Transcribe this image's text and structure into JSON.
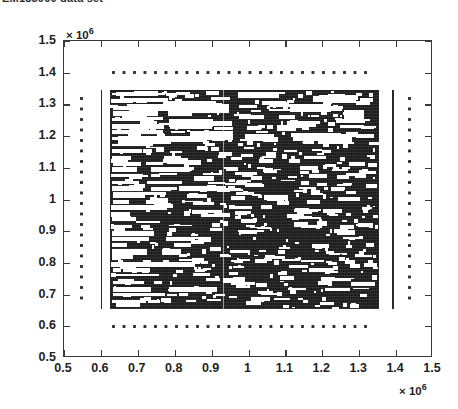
{
  "caption": {
    "text": "EM185900 data set"
  },
  "chart_data": {
    "type": "scatter",
    "title": "EM185900 data set",
    "xlabel": "",
    "ylabel": "",
    "grid": false,
    "legend": null,
    "x_multiplier": "× 10",
    "x_multiplier_exp": "6",
    "y_multiplier": "× 10",
    "y_multiplier_exp": "6",
    "xlim": [
      500000,
      1500000
    ],
    "ylim": [
      500000,
      1500000
    ],
    "x_ticks": [
      0.5,
      0.6,
      0.7,
      0.8,
      0.9,
      1,
      1.1,
      1.2,
      1.3,
      1.4,
      1.5
    ],
    "y_ticks": [
      0.5,
      0.6,
      0.7,
      0.8,
      0.9,
      1,
      1.1,
      1.2,
      1.3,
      1.4,
      1.5
    ],
    "x_tick_labels": [
      "0.5",
      "0.6",
      "0.7",
      "0.8",
      "0.9",
      "1",
      "1.1",
      "1.2",
      "1.3",
      "1.4",
      "1.5"
    ],
    "y_tick_labels": [
      "0.5",
      "0.6",
      "0.7",
      "0.8",
      "0.9",
      "1",
      "1.1",
      "1.2",
      "1.3",
      "1.4",
      "1.5"
    ],
    "marker_color": "#1b1b1b",
    "background_color": "#ffffff",
    "axis_color": "#3a3a3a",
    "clusters": [
      {
        "name": "main-block",
        "shape": "filled-rectangle",
        "x_range": [
          625000,
          1355000
        ],
        "y_range": [
          655000,
          1345000
        ],
        "density": "very-high",
        "notes": "near-solid black fill with white rectangular voids; left margin heavily striped"
      },
      {
        "name": "left-solid-line",
        "shape": "vertical-line",
        "x": 600000,
        "y_range": [
          655000,
          1345000
        ],
        "density": "high"
      },
      {
        "name": "right-solid-line",
        "shape": "vertical-line",
        "x": 1390000,
        "y_range": [
          655000,
          1345000
        ],
        "density": "high"
      },
      {
        "name": "left-dotted-column",
        "shape": "dotted-vertical",
        "x": 550000,
        "y_range": [
          680000,
          1320000
        ],
        "spacing": 28000
      },
      {
        "name": "right-dotted-column",
        "shape": "dotted-vertical",
        "x": 1440000,
        "y_range": [
          680000,
          1320000
        ],
        "spacing": 28000
      },
      {
        "name": "top-dotted-row",
        "shape": "dotted-horizontal",
        "y": 1400000,
        "x_range": [
          630000,
          1330000
        ],
        "spacing": 28000
      },
      {
        "name": "bottom-dotted-row",
        "shape": "dotted-horizontal",
        "y": 600000,
        "x_range": [
          630000,
          1330000
        ],
        "spacing": 28000
      },
      {
        "name": "interior-faint-vertical",
        "shape": "vertical-gap-line",
        "x": 930000,
        "y_range": [
          655000,
          1345000
        ],
        "density": "void"
      }
    ]
  }
}
